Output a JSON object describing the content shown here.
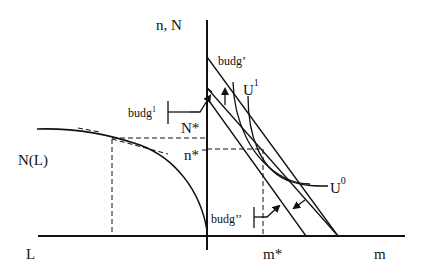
{
  "diagram": {
    "axes": {
      "vertical_label": "n, N",
      "horizontal_right_label": "m",
      "horizontal_left_label": "L"
    },
    "curves": {
      "production_curve_label": "N(L)",
      "indifference_high_label": "U",
      "indifference_high_sup": "1",
      "indifference_low_label": "U",
      "indifference_low_sup": "0"
    },
    "budget_lines": {
      "upper_label": "budg’",
      "middle_label": "budg",
      "middle_sup": "1",
      "lower_label": "budg’’"
    },
    "points": {
      "N_star": "N*",
      "n_star": "n*",
      "m_star": "m*"
    },
    "colors": {
      "ink": "#111111",
      "background": "#ffffff"
    }
  }
}
